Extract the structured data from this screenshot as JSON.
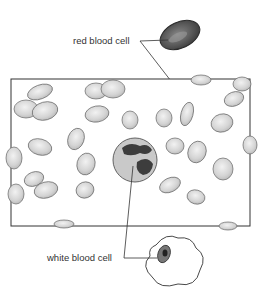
{
  "labels": {
    "red_blood_cell": "red blood cell",
    "white_blood_cell": "white blood cell"
  },
  "colors": {
    "outline": "#3a3a3a",
    "rbc_fill": "#d8d8d8",
    "rbc_dark": "#555555",
    "wbc_fill": "#cfcfcf",
    "nucleus": "#3d3d3d"
  }
}
